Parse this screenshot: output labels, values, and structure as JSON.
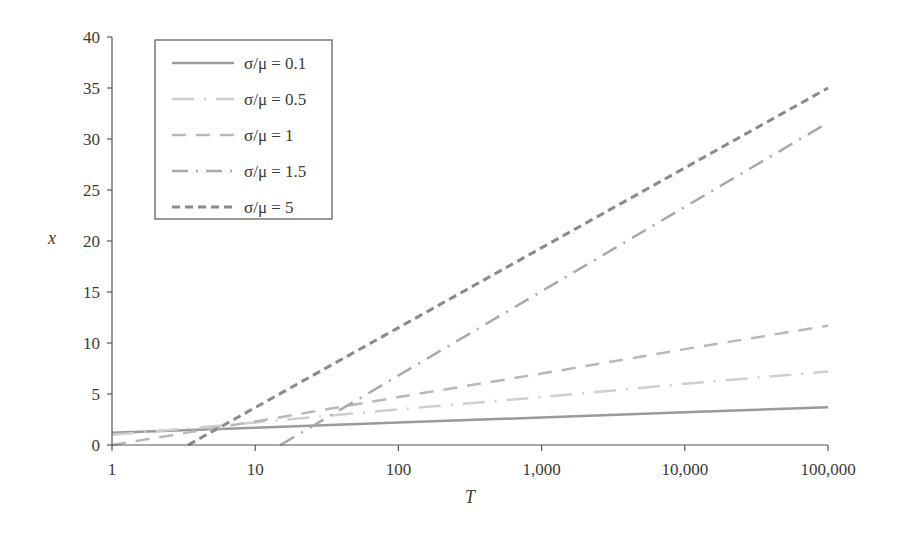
{
  "chart_data": {
    "type": "line",
    "title": "",
    "xlabel": "T",
    "ylabel": "x",
    "xscale": "log",
    "xlim": [
      1,
      100000
    ],
    "ylim": [
      0,
      40
    ],
    "grid": false,
    "legend_position": "upper-left",
    "x_ticks": [
      1,
      10,
      100,
      1000,
      10000,
      100000
    ],
    "x_tick_labels": [
      "1",
      "10",
      "100",
      "1,000",
      "10,000",
      "100,000"
    ],
    "y_ticks": [
      0,
      5,
      10,
      15,
      20,
      25,
      30,
      35,
      40
    ],
    "y_tick_labels": [
      "0",
      "5",
      "10",
      "15",
      "20",
      "25",
      "30",
      "35",
      "40"
    ],
    "x": [
      1,
      10,
      100,
      1000,
      10000,
      100000
    ],
    "series": [
      {
        "name": "σ/μ = 0.1",
        "style": "solid",
        "color": "#9a9a9a",
        "width": 2.5,
        "dash": "",
        "values": [
          1.2,
          1.7,
          2.2,
          2.7,
          3.2,
          3.7
        ]
      },
      {
        "name": "σ/μ = 0.5",
        "style": "long-dash-dot",
        "color": "#cfcfcf",
        "width": 2.5,
        "dash": "22,10,2,10",
        "values": [
          1.0,
          2.2,
          3.5,
          4.7,
          6.0,
          7.2
        ]
      },
      {
        "name": "σ/μ = 1",
        "style": "dashed",
        "color": "#b8b8b8",
        "width": 2.5,
        "dash": "14,10",
        "values": [
          0.0,
          2.3,
          4.7,
          7.0,
          9.4,
          11.7
        ]
      },
      {
        "name": "σ/μ = 1.5",
        "style": "dash-dot",
        "color": "#a8a8a8",
        "width": 2.5,
        "dash": "16,8,2,8",
        "x_start": 15,
        "values_from_start": [
          0,
          31.6
        ],
        "values": [
          null,
          null,
          7.5,
          15.6,
          23.6,
          31.6
        ]
      },
      {
        "name": "σ/μ = 5",
        "style": "short-dash",
        "color": "#8a8a8a",
        "width": 3,
        "dash": "8,5",
        "x_start": 3.4,
        "values_from_start": [
          0,
          35
        ],
        "values": [
          null,
          7.5,
          14.3,
          21.2,
          28.1,
          35.0
        ]
      }
    ]
  }
}
